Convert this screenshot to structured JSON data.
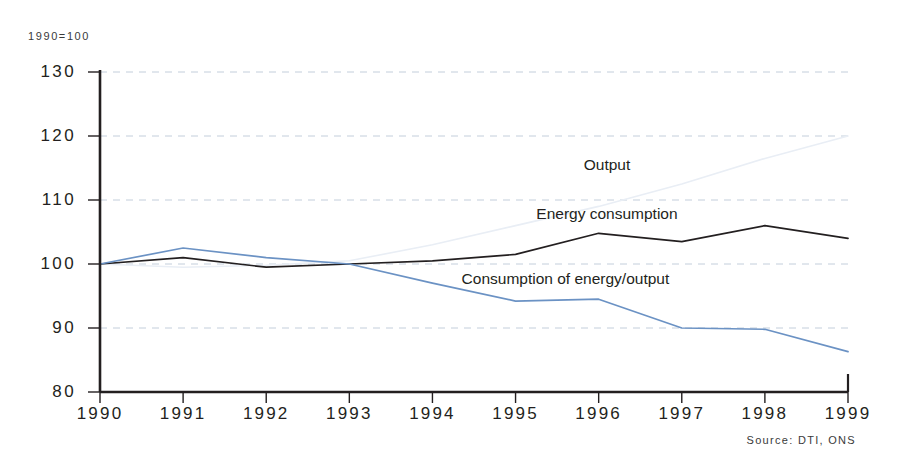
{
  "chart_data": {
    "type": "line",
    "title": "",
    "subtitle": "1990=100",
    "xlabel": "",
    "ylabel": "",
    "categories": [
      "1990",
      "1991",
      "1992",
      "1993",
      "1994",
      "1995",
      "1996",
      "1997",
      "1998",
      "1999"
    ],
    "x": [
      1990,
      1991,
      1992,
      1993,
      1994,
      1995,
      1996,
      1997,
      1998,
      1999
    ],
    "xlim": [
      1990,
      1999
    ],
    "ylim": [
      80,
      130
    ],
    "y_ticks": [
      80,
      90,
      100,
      110,
      120,
      130
    ],
    "x_ticks": [
      1990,
      1991,
      1992,
      1993,
      1994,
      1995,
      1996,
      1997,
      1998,
      1999
    ],
    "grid": "horizontal-dashed",
    "legend": "inline-labels",
    "series": [
      {
        "name": "Output",
        "color": "#e9eef5",
        "values": [
          100,
          99.5,
          99.8,
          100.5,
          103,
          106,
          109,
          112.5,
          116.5,
          120
        ]
      },
      {
        "name": "Energy consumption",
        "color": "#231f20",
        "values": [
          100,
          101,
          99.5,
          100,
          100.5,
          101.5,
          104.8,
          103.5,
          106,
          104
        ]
      },
      {
        "name": "Consumption of energy/output",
        "color": "#6b92c4",
        "values": [
          100,
          102.5,
          101,
          100,
          97,
          94.2,
          94.5,
          90,
          89.8,
          86.3
        ]
      }
    ],
    "annotations": [
      {
        "text": "Output",
        "x": 1996.1,
        "y": 115.4
      },
      {
        "text": "Energy consumption",
        "x": 1996.1,
        "y": 107.8
      },
      {
        "text": "Consumption of energy/output",
        "x": 1995.6,
        "y": 97.6
      }
    ],
    "source": "Source: DTI, ONS"
  },
  "colors": {
    "axis": "#231f20",
    "grid": "#b9c6d6",
    "background": "#ffffff",
    "output_line": "#e9eef5",
    "energy_line": "#231f20",
    "ratio_line": "#6b92c4"
  }
}
